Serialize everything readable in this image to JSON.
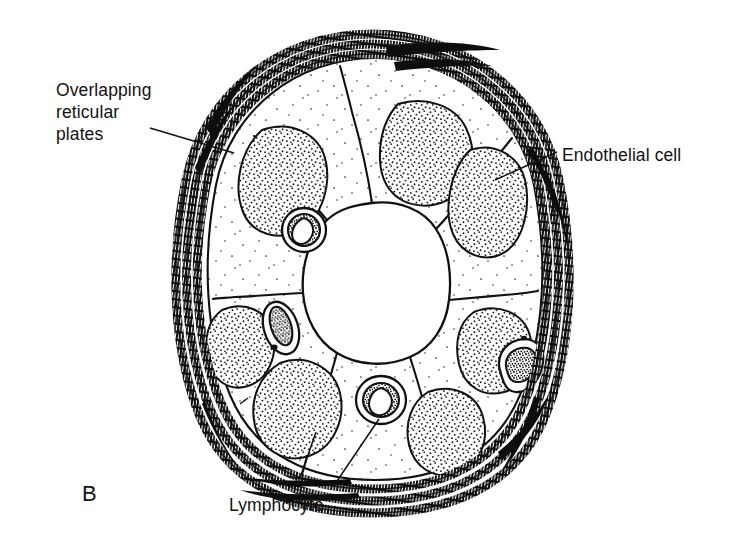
{
  "figure": {
    "panel_letter": "B",
    "kind": "biological-cross-section-diagram",
    "background_color": "#ffffff",
    "ink_color": "#111111",
    "labels": [
      {
        "id": "overlapping-reticular-plates",
        "text": "Overlapping\nreticular\nplates",
        "lines": [
          "Overlapping",
          "reticular",
          "plates"
        ],
        "position": "left",
        "leader_from": [
          150,
          131
        ],
        "leader_to": [
          232,
          152
        ]
      },
      {
        "id": "endothelial-cell",
        "text": "Endothelial cell",
        "lines": [
          "Endothelial cell"
        ],
        "position": "right",
        "leader_from": [
          556,
          155
        ],
        "leader_to": [
          497,
          178
        ]
      },
      {
        "id": "lymphocyte",
        "text": "Lymphocyte",
        "lines": [
          "Lymphocyte"
        ],
        "position": "bottom",
        "leader_from": [
          333,
          489
        ],
        "leader_to": [
          381,
          411
        ]
      }
    ],
    "structures": {
      "vessel_outline": "oval",
      "lumen": "central, unshaded",
      "endothelial_cell_count": 8,
      "nucleus_count": 8,
      "lymphocyte_count": 4,
      "reticular_plate_bands": 3,
      "nucleus_fill": "stipple",
      "cytoplasm_fill": "sparse-stipple",
      "plate_fill": "ladder-hatch"
    }
  }
}
